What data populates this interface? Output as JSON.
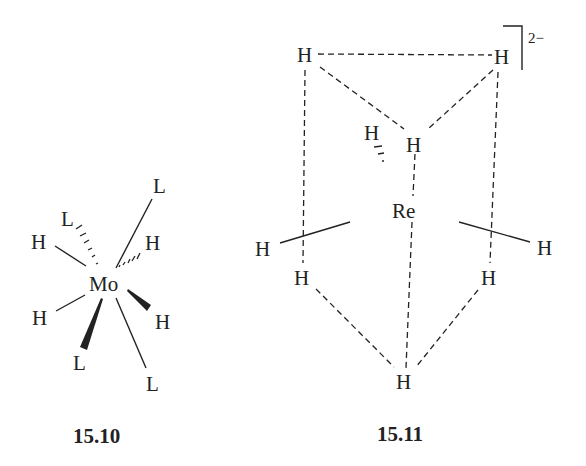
{
  "figure": {
    "structures": [
      {
        "id": "15.10",
        "label": "15.10",
        "metal": "Mo",
        "ligands": {
          "L_top_right": "L",
          "L_top_left": "L",
          "H_upper_left": "H",
          "H_upper_right": "H",
          "H_lower_left": "H",
          "H_lower_right": "H",
          "L_lower_left": "L",
          "L_lower_right": "L"
        }
      },
      {
        "id": "15.11",
        "label": "15.11",
        "metal": "Re",
        "charge": "2−",
        "atoms": {
          "H_top_left": "H",
          "H_top_right": "H",
          "H_inner": "H",
          "H_back": "H",
          "H_left": "H",
          "H_right": "H",
          "H_lower_left": "H",
          "H_lower_right": "H",
          "H_bottom": "H"
        }
      }
    ],
    "colors": {
      "ink": "#222222",
      "background": "#ffffff"
    }
  }
}
